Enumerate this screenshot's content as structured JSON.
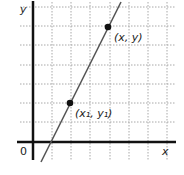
{
  "diagram": {
    "type": "coordinate-plane-line",
    "axes": {
      "x_label": "x",
      "y_label": "y",
      "origin_label": "0"
    },
    "grid": {
      "vertical_lines_x": [
        52,
        71,
        90,
        110,
        129,
        148,
        167
      ],
      "horizontal_lines_y": [
        7,
        26,
        45,
        65,
        84,
        103,
        122
      ]
    },
    "points": [
      {
        "label": "(x, y)",
        "px": 108,
        "py": 26
      },
      {
        "label": "(x₁, y₁)",
        "px": 70,
        "py": 103
      }
    ],
    "line": {
      "from": [
        41,
        162
      ],
      "to": [
        121,
        2
      ]
    },
    "colors": {
      "axis": "#111111",
      "grid": "#9a9a9a",
      "line": "#555555",
      "point": "#111111"
    }
  }
}
